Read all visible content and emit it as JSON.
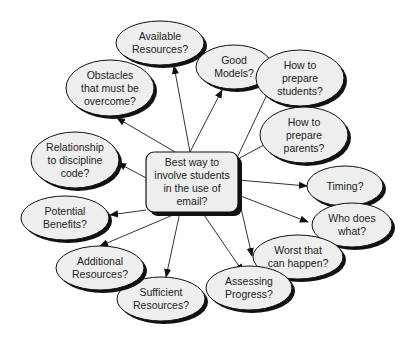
{
  "diagram": {
    "type": "concept-map",
    "colors": {
      "background": "#ffffff",
      "node_fill": "#eeeeee",
      "node_stroke": "#111111",
      "shadow": "#111111",
      "edge": "#333333",
      "text": "#222222"
    },
    "center": {
      "id": "center",
      "lines": [
        "Best way to",
        "involve students",
        "in the use of",
        "email?"
      ],
      "x": 146,
      "y": 152,
      "w": 92,
      "h": 60
    },
    "nodes": [
      {
        "id": "available-resources",
        "lines": [
          "Available",
          "Resources?"
        ],
        "cx": 160,
        "cy": 43,
        "rx": 44,
        "ry": 22,
        "ax": 174,
        "ay": 66
      },
      {
        "id": "good-models",
        "lines": [
          "Good",
          "Models?"
        ],
        "cx": 234,
        "cy": 67,
        "rx": 38,
        "ry": 22,
        "ax": 222,
        "ay": 90
      },
      {
        "id": "prepare-students",
        "lines": [
          "How to",
          "prepare",
          "students?"
        ],
        "cx": 300,
        "cy": 78,
        "rx": 44,
        "ry": 28,
        "ax": 272,
        "ay": 84
      },
      {
        "id": "prepare-parents",
        "lines": [
          "How to",
          "prepare",
          "parents?"
        ],
        "cx": 304,
        "cy": 135,
        "rx": 44,
        "ry": 28,
        "ax": 275,
        "ay": 139
      },
      {
        "id": "timing",
        "lines": [
          "Timing?"
        ],
        "cx": 345,
        "cy": 186,
        "rx": 38,
        "ry": 20,
        "ax": 307,
        "ay": 186
      },
      {
        "id": "who-does-what",
        "lines": [
          "Who does",
          "what?"
        ],
        "cx": 352,
        "cy": 225,
        "rx": 40,
        "ry": 22,
        "ax": 308,
        "ay": 222
      },
      {
        "id": "worst-case",
        "lines": [
          "Worst that",
          "can happen?"
        ],
        "cx": 298,
        "cy": 257,
        "rx": 45,
        "ry": 22,
        "ax": 252,
        "ay": 256
      },
      {
        "id": "assessing-progress",
        "lines": [
          "Assessing",
          "Progress?"
        ],
        "cx": 249,
        "cy": 288,
        "rx": 43,
        "ry": 22,
        "ax": 243,
        "ay": 272
      },
      {
        "id": "sufficient-resources",
        "lines": [
          "Sufficient",
          "Resources?"
        ],
        "cx": 161,
        "cy": 299,
        "rx": 44,
        "ry": 22,
        "ax": 166,
        "ay": 277
      },
      {
        "id": "additional-resources",
        "lines": [
          "Additional",
          "Resources?"
        ],
        "cx": 100,
        "cy": 268,
        "rx": 44,
        "ry": 22,
        "ax": 100,
        "ay": 246
      },
      {
        "id": "potential-benefits",
        "lines": [
          "Potential",
          "Benefits?"
        ],
        "cx": 65,
        "cy": 218,
        "rx": 44,
        "ry": 22,
        "ax": 110,
        "ay": 215
      },
      {
        "id": "discipline-code",
        "lines": [
          "Relationship",
          "to discipline",
          "code?"
        ],
        "cx": 75,
        "cy": 160,
        "rx": 44,
        "ry": 28,
        "ax": 118,
        "ay": 163
      },
      {
        "id": "obstacles",
        "lines": [
          "Obstacles",
          "that must be",
          "overcome?"
        ],
        "cx": 110,
        "cy": 88,
        "rx": 44,
        "ry": 28,
        "ax": 117,
        "ay": 118
      }
    ],
    "edge_origin": {
      "x": 190,
      "y": 152
    }
  }
}
